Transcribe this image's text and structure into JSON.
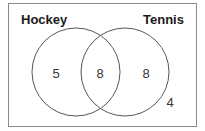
{
  "diagram": {
    "type": "venn",
    "sets": [
      {
        "name": "Hockey"
      },
      {
        "name": "Tennis"
      }
    ],
    "regions": {
      "hockey_only": "5",
      "both": "8",
      "tennis_only": "8",
      "neither": "4"
    },
    "colors": {
      "border": "#8a8a8a",
      "circle": "#555555",
      "text": "#1a1a1a"
    }
  }
}
